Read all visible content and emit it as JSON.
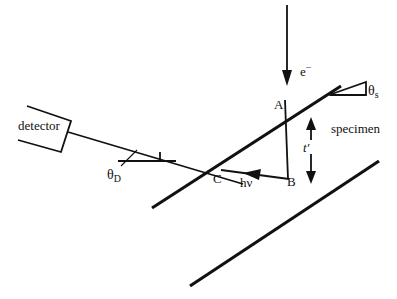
{
  "figure": {
    "type": "schematic-diagram",
    "background_color": "#ffffff",
    "line_color": "#111111"
  },
  "labels": {
    "detector": "detector",
    "specimen": "specimen",
    "electron_beam": "e",
    "electron_beam_charge": "−",
    "theta_s": "θ",
    "theta_s_sub": "s",
    "theta_d": "θ",
    "theta_d_sub": "D",
    "point_a": "A",
    "point_b": "B",
    "point_c": "C",
    "photon": "hν",
    "thickness": "t′"
  },
  "geometry": {
    "electron_beam": {
      "from_x": 287,
      "from_y": 5,
      "to_x": 287,
      "to_y": 84,
      "arrow_tip_x": 287,
      "arrow_tip_y": 84
    },
    "specimen_top_surface": {
      "x1": 152,
      "y1": 208,
      "x2": 341,
      "y2": 86
    },
    "specimen_bottom_surface": {
      "x1": 190,
      "y1": 286,
      "x2": 379,
      "y2": 161
    },
    "detector_ray": {
      "x1": 68,
      "y1": 132,
      "x2": 240,
      "y2": 183
    },
    "vertical_segment_ab": {
      "x1": 285,
      "y1": 104,
      "x2": 288,
      "y2": 179
    },
    "photon_ray": {
      "from_x": 288,
      "from_y": 178,
      "to_x": 218,
      "to_y": 170
    },
    "thickness_arrow": {
      "x": 311,
      "top_y": 118,
      "bottom_y": 183
    },
    "theta_s_marker": {
      "apex_x": 329,
      "apex_y": 94,
      "corner_x": 365,
      "corner_y": 82,
      "base_x": 365,
      "base_y": 94
    },
    "theta_d_marker": {
      "h_line_x1": 118,
      "h_line_y": 161,
      "h_line_x2": 175,
      "vertex_x": 168,
      "vertex_y": 152
    },
    "detector_box": {
      "points": "27,106 71,121 61,152 18,140"
    }
  }
}
